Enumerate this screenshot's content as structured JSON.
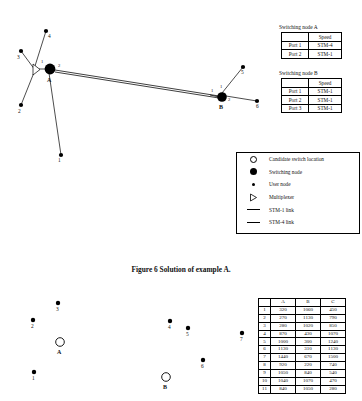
{
  "figure": {
    "caption": "Figure 6  Solution of example A."
  },
  "top_diagram": {
    "switch_nodes": [
      {
        "id": "A",
        "label": "A",
        "x": 50,
        "y": 69,
        "r": 5.5
      },
      {
        "id": "B",
        "label": "B",
        "x": 222,
        "y": 97,
        "r": 5.0
      }
    ],
    "user_nodes": [
      {
        "label": "1",
        "x": 61,
        "y": 155
      },
      {
        "label": "2",
        "x": 21,
        "y": 105
      },
      {
        "label": "3",
        "x": 21,
        "y": 51
      },
      {
        "label": "4",
        "x": 46,
        "y": 31
      },
      {
        "label": "5",
        "x": 243,
        "y": 67
      },
      {
        "label": "6",
        "x": 257,
        "y": 101
      }
    ],
    "multiplexer": {
      "x": 35,
      "y": 70
    },
    "port_labels": [
      {
        "text": "1",
        "x": 42,
        "y": 62
      },
      {
        "text": "2",
        "x": 59,
        "y": 67
      },
      {
        "text": "1",
        "x": 213,
        "y": 92
      },
      {
        "text": "1",
        "x": 221,
        "y": 88
      },
      {
        "text": "2",
        "x": 229,
        "y": 100
      }
    ],
    "links": [
      {
        "from": "mux",
        "to": "node3",
        "type": "STM-1"
      },
      {
        "from": "mux",
        "to": "node2",
        "type": "STM-1"
      },
      {
        "from": "mux",
        "to": "node4",
        "type": "STM-1"
      },
      {
        "from": "mux",
        "to": "A",
        "type": "STM-1"
      },
      {
        "from": "A",
        "to": "node1",
        "type": "STM-1"
      },
      {
        "from": "A",
        "to": "B",
        "type": "STM-4"
      },
      {
        "from": "B",
        "to": "node5",
        "type": "STM-1"
      },
      {
        "from": "B",
        "to": "node6",
        "type": "STM-1"
      }
    ]
  },
  "table_a": {
    "title": "Switching node A",
    "headers": [
      "",
      "Speed"
    ],
    "rows": [
      [
        "Port 1",
        "STM-4"
      ],
      [
        "Port 2",
        "STM-1"
      ]
    ]
  },
  "table_b": {
    "title": "Switching node B",
    "headers": [
      "",
      "Speed"
    ],
    "rows": [
      [
        "Port 1",
        "STM-1"
      ],
      [
        "Port 2",
        "STM-1"
      ],
      [
        "Port 3",
        "STM-1"
      ]
    ]
  },
  "legend": {
    "items": [
      {
        "symbol": "open-circle",
        "label": "Candidate switch location"
      },
      {
        "symbol": "filled-circle",
        "label": "Switching node"
      },
      {
        "symbol": "small-dot",
        "label": "User node"
      },
      {
        "symbol": "triangle",
        "label": "Multiplexer"
      },
      {
        "symbol": "thin-line",
        "label": "STM-1 link"
      },
      {
        "symbol": "thick-line",
        "label": "STM-4 link"
      }
    ]
  },
  "bottom_diagram": {
    "candidate_locations": [
      {
        "label": "A",
        "x": 60,
        "y": 342
      },
      {
        "label": "B",
        "x": 166,
        "y": 377
      }
    ],
    "user_nodes": [
      {
        "label": "1",
        "x": 34,
        "y": 372
      },
      {
        "label": "2",
        "x": 33,
        "y": 320
      },
      {
        "label": "3",
        "x": 58,
        "y": 303
      },
      {
        "label": "4",
        "x": 170,
        "y": 321
      },
      {
        "label": "5",
        "x": 188,
        "y": 328
      },
      {
        "label": "6",
        "x": 203,
        "y": 360
      },
      {
        "label": "7",
        "x": 242,
        "y": 333
      }
    ]
  },
  "data_table": {
    "headers": [
      "",
      "A",
      "B",
      "C"
    ],
    "rows": [
      [
        "1",
        "320",
        "1060",
        "450"
      ],
      [
        "2",
        "270",
        "1130",
        "790"
      ],
      [
        "3",
        "280",
        "1020",
        "850"
      ],
      [
        "4",
        "870",
        "430",
        "1070"
      ],
      [
        "5",
        "1000",
        "300",
        "1240"
      ],
      [
        "6",
        "1130",
        "310",
        "1130"
      ],
      [
        "7",
        "1440",
        "670",
        "1500"
      ],
      [
        "8",
        "920",
        "220",
        "740"
      ],
      [
        "9",
        "1050",
        "840",
        "540"
      ],
      [
        "10",
        "1040",
        "1070",
        "470"
      ],
      [
        "11",
        "840",
        "1050",
        "280"
      ]
    ]
  }
}
